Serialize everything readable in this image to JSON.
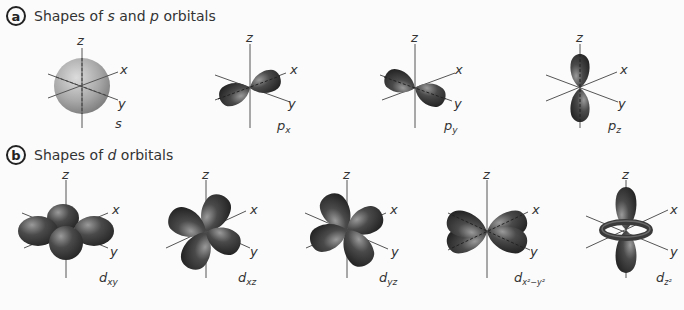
{
  "section_a": {
    "badge": "a",
    "title_pre": "Shapes of ",
    "title_s": "s",
    "title_mid": " and ",
    "title_p": "p",
    "title_post": " orbitals",
    "orbitals": [
      {
        "name": "s",
        "label": "s",
        "sub": ""
      },
      {
        "name": "px",
        "label": "p",
        "sub": "x"
      },
      {
        "name": "py",
        "label": "p",
        "sub": "y"
      },
      {
        "name": "pz",
        "label": "p",
        "sub": "z"
      }
    ]
  },
  "section_b": {
    "badge": "b",
    "title_pre": "Shapes of ",
    "title_d": "d",
    "title_post": " orbitals",
    "orbitals": [
      {
        "name": "dxy",
        "label": "d",
        "sub": "xy"
      },
      {
        "name": "dxz",
        "label": "d",
        "sub": "xz"
      },
      {
        "name": "dyz",
        "label": "d",
        "sub": "yz"
      },
      {
        "name": "dx2-y2",
        "label": "d",
        "sub": "x²−y²"
      },
      {
        "name": "dz2",
        "label": "d",
        "sub": "z²"
      }
    ]
  },
  "axes": {
    "x": "x",
    "y": "y",
    "z": "z"
  },
  "colors": {
    "lobe_dark": "#3a3a3a",
    "lobe_light": "#8a8a8a",
    "sphere": "#b5b5b5",
    "axis": "#555555"
  }
}
